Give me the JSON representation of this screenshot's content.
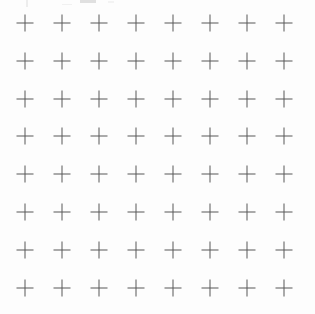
{
  "page": {
    "width": 315,
    "height": 314,
    "background_color": "#fdfdfd"
  },
  "grid": {
    "name": "cross-mark-grid",
    "columns": 8,
    "rows": 8,
    "total_marks": 64,
    "mark_glyph": "+",
    "mark_semantic": "plus-cross-mark",
    "mark_color": "#585858",
    "stroke_width_px": 1,
    "mark_size_px": 17,
    "origin_x_px": 25,
    "origin_y_px": 23,
    "spacing_x_px": 37,
    "spacing_y_px": 37.8,
    "column_centers_x": [
      25,
      62,
      99,
      136,
      173,
      210,
      247,
      284
    ],
    "row_centers_y": [
      23,
      61,
      99,
      136,
      174,
      212,
      250,
      288
    ]
  },
  "artifacts": {
    "name": "scan-edge-artifacts",
    "description": "faint clipped marks along the top edge",
    "color": "#c9c9c9",
    "count": 4
  }
}
